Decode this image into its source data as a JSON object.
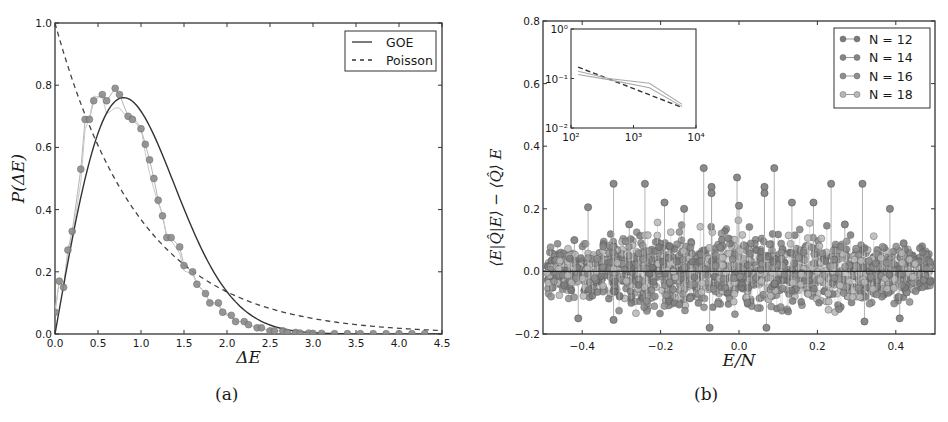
{
  "figure": {
    "caption_a": "(a)",
    "caption_b": "(b)"
  },
  "chart_data": [
    {
      "id": "a",
      "type": "line",
      "title": "",
      "xlabel": "ΔE",
      "ylabel": "P(ΔE)",
      "xlim": [
        0.0,
        4.5
      ],
      "ylim": [
        0.0,
        1.0
      ],
      "xticks": [
        "0.0",
        "0.5",
        "1.0",
        "1.5",
        "2.0",
        "2.5",
        "3.0",
        "3.5",
        "4.0",
        "4.5"
      ],
      "yticks": [
        "0.0",
        "0.2",
        "0.4",
        "0.6",
        "0.8",
        "1.0"
      ],
      "grid": false,
      "legend_position": "upper right",
      "legend": [
        {
          "label": "GOE",
          "style": "solid"
        },
        {
          "label": "Poisson",
          "style": "dashed"
        }
      ],
      "series": [
        {
          "name": "GOE",
          "style": "solid",
          "formula": "(pi/2) x exp(-pi x^2 / 4)",
          "x": [
            0.0,
            0.1,
            0.2,
            0.3,
            0.4,
            0.5,
            0.6,
            0.7,
            0.8,
            0.9,
            1.0,
            1.1,
            1.2,
            1.3,
            1.4,
            1.5,
            1.6,
            1.7,
            1.8,
            1.9,
            2.0,
            2.2,
            2.4,
            2.6,
            2.8,
            3.0,
            3.5,
            4.0,
            4.5
          ],
          "y": [
            0.0,
            0.156,
            0.304,
            0.437,
            0.551,
            0.644,
            0.711,
            0.75,
            0.761,
            0.747,
            0.717,
            0.663,
            0.599,
            0.525,
            0.448,
            0.373,
            0.302,
            0.238,
            0.183,
            0.137,
            0.081,
            0.04,
            0.021,
            0.009,
            0.003,
            0.001,
            0.0,
            0.0,
            0.0
          ]
        },
        {
          "name": "Poisson",
          "style": "dashed",
          "formula": "exp(-x)",
          "x": [
            0.0,
            0.25,
            0.5,
            0.75,
            1.0,
            1.25,
            1.5,
            1.75,
            2.0,
            2.5,
            3.0,
            3.5,
            4.0,
            4.5
          ],
          "y": [
            1.0,
            0.779,
            0.607,
            0.472,
            0.368,
            0.287,
            0.223,
            0.174,
            0.135,
            0.082,
            0.05,
            0.03,
            0.018,
            0.011
          ]
        },
        {
          "name": "data (markers)",
          "style": "markers+thin-line",
          "x": [
            0.0,
            0.05,
            0.1,
            0.15,
            0.2,
            0.3,
            0.35,
            0.4,
            0.45,
            0.55,
            0.6,
            0.7,
            0.75,
            0.85,
            0.9,
            1.0,
            1.05,
            1.1,
            1.15,
            1.2,
            1.25,
            1.3,
            1.35,
            1.45,
            1.5,
            1.6,
            1.65,
            1.75,
            1.8,
            1.9,
            1.95,
            2.05,
            2.1,
            2.2,
            2.25,
            2.35,
            2.4,
            2.5,
            2.55,
            2.65,
            2.7,
            2.8,
            2.85,
            2.95,
            3.0,
            3.1,
            3.25,
            3.4,
            3.55,
            3.7,
            3.85,
            4.0,
            4.15,
            4.3
          ],
          "y": [
            0.07,
            0.17,
            0.15,
            0.27,
            0.33,
            0.53,
            0.69,
            0.69,
            0.75,
            0.77,
            0.75,
            0.79,
            0.77,
            0.7,
            0.69,
            0.66,
            0.61,
            0.56,
            0.5,
            0.43,
            0.38,
            0.31,
            0.31,
            0.28,
            0.22,
            0.2,
            0.16,
            0.13,
            0.1,
            0.1,
            0.07,
            0.06,
            0.04,
            0.04,
            0.03,
            0.02,
            0.02,
            0.01,
            0.01,
            0.01,
            0.005,
            0.005,
            0.003,
            0.003,
            0.002,
            0.002,
            0.001,
            0.001,
            0.001,
            0.001,
            0.001,
            0.001,
            0.001,
            0.001
          ]
        }
      ]
    },
    {
      "id": "b",
      "type": "scatter",
      "title": "",
      "xlabel": "E/N",
      "ylabel": "⟨E|Q̂_{N/2}|E⟩ − ⟨Q̂_{N/2}⟩_E",
      "xlim": [
        -0.5,
        0.5
      ],
      "ylim": [
        -0.2,
        0.8
      ],
      "xticks": [
        "-0.4",
        "-0.2",
        "0.0",
        "0.2",
        "0.4"
      ],
      "yticks": [
        "-0.2",
        "0.0",
        "0.2",
        "0.4",
        "0.6",
        "0.8"
      ],
      "grid": false,
      "legend_position": "upper right",
      "legend": [
        {
          "label": "N = 12",
          "color": "#7a7a7a"
        },
        {
          "label": "N = 14",
          "color": "#858585"
        },
        {
          "label": "N = 16",
          "color": "#8e8e8e"
        },
        {
          "label": "N = 18",
          "color": "#b8b8b8"
        }
      ],
      "reference_line": {
        "y": 0.0,
        "color": "#222222"
      },
      "description": "Dense cloud of stem-markers scattered about y=0 for E/N in [-0.5, 0.5]; spread up to about ±0.15 near center, decreasing toward edges; outliers up to ~0.33 and down to ~-0.18.",
      "outliers": [
        {
          "x": -0.42,
          "y": 0.1
        },
        {
          "x": -0.41,
          "y": -0.15
        },
        {
          "x": -0.385,
          "y": 0.205
        },
        {
          "x": -0.32,
          "y": 0.28
        },
        {
          "x": -0.32,
          "y": -0.155
        },
        {
          "x": -0.28,
          "y": 0.15
        },
        {
          "x": -0.24,
          "y": 0.28
        },
        {
          "x": -0.19,
          "y": 0.22
        },
        {
          "x": -0.14,
          "y": 0.2
        },
        {
          "x": -0.09,
          "y": 0.33
        },
        {
          "x": -0.07,
          "y": 0.27
        },
        {
          "x": -0.07,
          "y": 0.25
        },
        {
          "x": -0.075,
          "y": -0.18
        },
        {
          "x": -0.005,
          "y": 0.3
        },
        {
          "x": 0.0,
          "y": 0.21
        },
        {
          "x": 0.065,
          "y": 0.27
        },
        {
          "x": 0.065,
          "y": 0.25
        },
        {
          "x": 0.07,
          "y": -0.18
        },
        {
          "x": 0.09,
          "y": 0.33
        },
        {
          "x": 0.135,
          "y": 0.22
        },
        {
          "x": 0.19,
          "y": 0.22
        },
        {
          "x": 0.235,
          "y": 0.28
        },
        {
          "x": 0.27,
          "y": 0.15
        },
        {
          "x": 0.315,
          "y": 0.28
        },
        {
          "x": 0.32,
          "y": -0.16
        },
        {
          "x": 0.385,
          "y": 0.2
        },
        {
          "x": 0.41,
          "y": -0.15
        },
        {
          "x": 0.42,
          "y": 0.09
        }
      ],
      "inset": {
        "type": "line",
        "xscale": "log",
        "yscale": "log",
        "xlim": [
          100,
          10000
        ],
        "ylim": [
          0.01,
          1
        ],
        "xticks": [
          "10²",
          "10³",
          "10⁴"
        ],
        "yticks": [
          "10⁻²",
          "10⁻¹",
          "10⁰"
        ],
        "series": [
          {
            "name": "fit",
            "style": "dashed",
            "x": [
              130,
              6000
            ],
            "y": [
              0.17,
              0.026
            ]
          },
          {
            "name": "data-1",
            "style": "solid",
            "x": [
              130,
              400,
              1800,
              6000
            ],
            "y": [
              0.14,
              0.1,
              0.08,
              0.03
            ]
          },
          {
            "name": "data-2",
            "style": "solid",
            "x": [
              130,
              400,
              1800,
              6000
            ],
            "y": [
              0.12,
              0.095,
              0.065,
              0.027
            ]
          }
        ]
      }
    }
  ]
}
